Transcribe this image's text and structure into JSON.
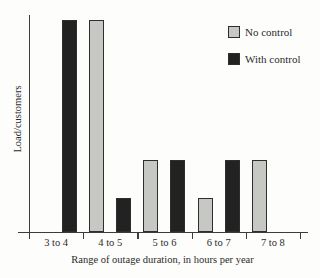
{
  "chart_data": {
    "type": "bar",
    "title": "",
    "xlabel": "Range of outage duration, in hours per year",
    "ylabel": "Load/customers",
    "categories": [
      "3 to 4",
      "4 to 5",
      "5 to 6",
      "6 to 7",
      "7 to 8"
    ],
    "series": [
      {
        "name": "No control",
        "color": "#c6c8c4",
        "values": [
          null,
          100,
          34,
          16,
          34
        ]
      },
      {
        "name": "With control",
        "color": "#222222",
        "values": [
          100,
          16,
          34,
          34,
          null
        ]
      }
    ],
    "value_scale": "relative bar height, tallest bar = 100 (y-axis has no numeric ticks)",
    "ylim": [
      0,
      100
    ],
    "grid": false,
    "legend_position": "top-right",
    "axis_color": "#3c3c3c"
  }
}
